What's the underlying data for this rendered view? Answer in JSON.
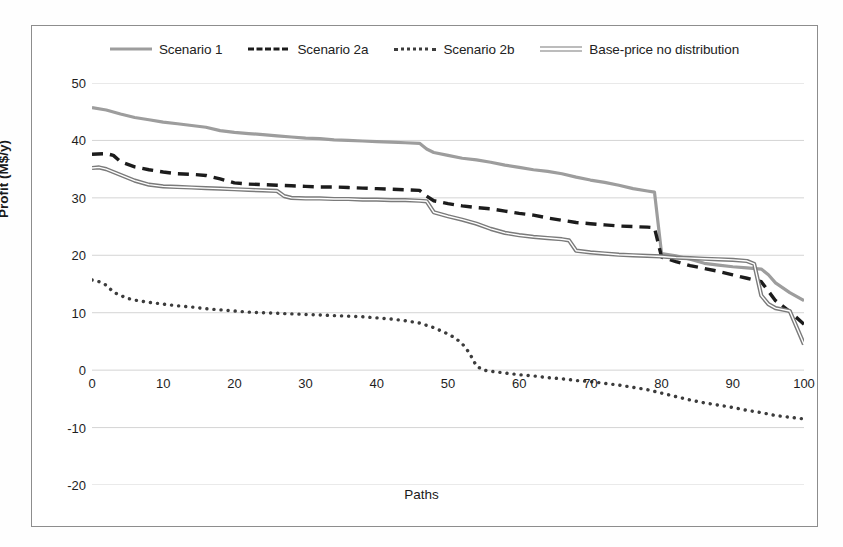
{
  "chart_data": {
    "type": "line",
    "title": "",
    "xlabel": "Paths",
    "ylabel": "Profit (M$/y)",
    "xlim": [
      0,
      100
    ],
    "ylim": [
      -20,
      50
    ],
    "xticks": [
      0,
      10,
      20,
      30,
      40,
      50,
      60,
      70,
      80,
      90,
      100
    ],
    "yticks": [
      50,
      40,
      30,
      20,
      10,
      0,
      -10,
      -20
    ],
    "grid": "horizontal",
    "legend_position": "top",
    "series": [
      {
        "name": "Scenario 1",
        "style": "solid",
        "color": "#9d9d9d",
        "x": [
          0,
          2,
          4,
          6,
          8,
          10,
          12,
          14,
          16,
          18,
          20,
          22,
          24,
          26,
          28,
          30,
          32,
          34,
          36,
          38,
          40,
          42,
          44,
          46,
          47,
          48,
          50,
          52,
          54,
          56,
          58,
          60,
          62,
          64,
          66,
          68,
          70,
          72,
          74,
          76,
          78,
          79,
          80,
          82,
          84,
          86,
          88,
          90,
          92,
          94,
          95,
          96,
          98,
          100
        ],
        "y": [
          45.7,
          45.3,
          44.6,
          44.0,
          43.6,
          43.2,
          42.9,
          42.6,
          42.3,
          41.7,
          41.4,
          41.2,
          41.0,
          40.8,
          40.6,
          40.4,
          40.3,
          40.1,
          40.0,
          39.9,
          39.8,
          39.7,
          39.6,
          39.5,
          38.5,
          37.9,
          37.4,
          36.9,
          36.6,
          36.2,
          35.7,
          35.3,
          34.9,
          34.6,
          34.2,
          33.6,
          33.1,
          32.7,
          32.2,
          31.6,
          31.2,
          31.0,
          20.3,
          19.9,
          19.3,
          18.6,
          18.3,
          18.0,
          17.8,
          17.6,
          16.6,
          15.2,
          13.5,
          12.1
        ]
      },
      {
        "name": "Scenario 2a",
        "style": "dashed",
        "color": "#1c1c1c",
        "x": [
          0,
          2,
          3,
          4,
          6,
          8,
          10,
          12,
          14,
          16,
          18,
          20,
          22,
          24,
          26,
          28,
          30,
          32,
          34,
          36,
          38,
          40,
          42,
          44,
          46,
          47,
          48,
          50,
          52,
          54,
          56,
          58,
          60,
          62,
          64,
          66,
          68,
          70,
          72,
          74,
          76,
          78,
          79,
          80,
          82,
          84,
          86,
          88,
          90,
          92,
          94,
          96,
          98,
          100
        ],
        "y": [
          37.6,
          37.7,
          37.4,
          36.3,
          35.4,
          34.9,
          34.5,
          34.2,
          34.1,
          33.9,
          33.3,
          32.6,
          32.4,
          32.3,
          32.2,
          32.1,
          32.0,
          31.9,
          31.9,
          31.8,
          31.7,
          31.6,
          31.5,
          31.4,
          31.3,
          30.3,
          29.5,
          29.0,
          28.6,
          28.3,
          28.1,
          27.7,
          27.3,
          27.0,
          26.5,
          26.1,
          25.7,
          25.5,
          25.3,
          25.1,
          25.0,
          24.9,
          24.8,
          19.7,
          18.9,
          18.2,
          17.7,
          17.2,
          16.6,
          16.0,
          15.4,
          12.1,
          10.2,
          8.0
        ]
      },
      {
        "name": "Scenario 2b",
        "style": "dotted",
        "color": "#3c3c3c",
        "x": [
          0,
          1,
          2,
          3,
          4,
          5,
          6,
          8,
          10,
          12,
          14,
          16,
          18,
          20,
          22,
          24,
          26,
          28,
          30,
          32,
          34,
          36,
          38,
          40,
          42,
          44,
          46,
          48,
          50,
          51,
          52,
          53,
          54,
          55,
          56,
          58,
          60,
          62,
          64,
          66,
          68,
          70,
          72,
          74,
          76,
          78,
          80,
          82,
          84,
          86,
          88,
          90,
          92,
          94,
          96,
          98,
          100
        ],
        "y": [
          15.7,
          15.4,
          14.8,
          13.6,
          13.0,
          12.5,
          12.2,
          11.8,
          11.5,
          11.2,
          11.0,
          10.7,
          10.5,
          10.3,
          10.1,
          10.0,
          9.9,
          9.8,
          9.7,
          9.6,
          9.5,
          9.4,
          9.3,
          9.1,
          8.9,
          8.6,
          8.2,
          7.4,
          6.3,
          5.6,
          4.6,
          3.0,
          0.7,
          0.0,
          -0.2,
          -0.5,
          -0.8,
          -1.0,
          -1.3,
          -1.5,
          -1.8,
          -2.0,
          -2.3,
          -2.6,
          -3.0,
          -3.4,
          -4.0,
          -4.6,
          -5.2,
          -5.7,
          -6.1,
          -6.5,
          -7.0,
          -7.4,
          -7.9,
          -8.2,
          -8.5
        ]
      },
      {
        "name": "Base-price no distribution",
        "style": "double",
        "color": "#7a7a7a",
        "x": [
          0,
          1,
          2,
          4,
          6,
          8,
          10,
          12,
          14,
          16,
          18,
          20,
          22,
          24,
          26,
          27,
          28,
          30,
          32,
          34,
          36,
          38,
          40,
          42,
          44,
          46,
          47,
          48,
          50,
          52,
          54,
          56,
          58,
          60,
          62,
          64,
          66,
          67,
          68,
          70,
          72,
          74,
          76,
          78,
          80,
          82,
          84,
          86,
          88,
          90,
          92,
          93,
          94,
          95,
          96,
          98,
          100
        ],
        "y": [
          35.2,
          35.3,
          35.0,
          34.0,
          33.0,
          32.3,
          32.0,
          31.9,
          31.8,
          31.7,
          31.6,
          31.5,
          31.4,
          31.3,
          31.2,
          30.3,
          30.0,
          29.9,
          29.9,
          29.8,
          29.8,
          29.7,
          29.7,
          29.6,
          29.6,
          29.5,
          29.4,
          27.5,
          26.8,
          26.2,
          25.5,
          24.6,
          23.9,
          23.5,
          23.2,
          23.0,
          22.8,
          22.6,
          20.8,
          20.5,
          20.3,
          20.1,
          20.0,
          19.9,
          19.8,
          19.6,
          19.5,
          19.4,
          19.3,
          19.2,
          19.0,
          18.5,
          13.0,
          11.5,
          10.8,
          10.3,
          4.5
        ]
      }
    ]
  },
  "legend": {
    "items": [
      {
        "label": "Scenario 1",
        "swatch": "solid-gray-line-swatch"
      },
      {
        "label": "Scenario 2a",
        "swatch": "dashed-black-line-swatch"
      },
      {
        "label": "Scenario 2b",
        "swatch": "dotted-gray-line-swatch"
      },
      {
        "label": "Base-price no distribution",
        "swatch": "double-gray-line-swatch"
      }
    ]
  }
}
